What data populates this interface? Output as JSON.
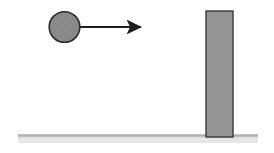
{
  "figure": {
    "name": "ball-approaching-wall-diagram",
    "type": "physics-schematic",
    "background_color": "#ffffff",
    "width": 274,
    "height": 153
  },
  "ball": {
    "name": "ball",
    "label": "",
    "shape": "circle",
    "center_x": 64.5,
    "center_y": 27,
    "radius": 15.5,
    "fill_color": "#8f8f8f",
    "stroke_color": "#2b2b2b",
    "stroke_width": 1.6
  },
  "velocity_arrow": {
    "name": "velocity-arrow",
    "label": "",
    "direction": "right",
    "start_x": 80,
    "start_y": 27,
    "end_x": 148,
    "end_y": 27,
    "line_width": 2.2,
    "head_length": 12,
    "head_width": 11,
    "color": "#1f1f1f"
  },
  "wall": {
    "name": "wall-block",
    "label": "",
    "shape": "rectangle",
    "x": 206,
    "y": 11,
    "width": 27,
    "height": 126,
    "fill_color": "#9a9a9a",
    "stroke_color": "#3a3a3a",
    "stroke_width": 1.4
  },
  "ground": {
    "name": "ground-line",
    "label": "",
    "x_start": 18,
    "x_end": 258,
    "y": 136,
    "thickness": 3,
    "color": "#bdbdbd",
    "shadow_color": "#e6e6e6"
  },
  "colors": {
    "ball_gray": "#8f8f8f",
    "wall_gray": "#9a9a9a",
    "outline_dark": "#2b2b2b",
    "ground_gray": "#bdbdbd",
    "background": "#ffffff"
  }
}
